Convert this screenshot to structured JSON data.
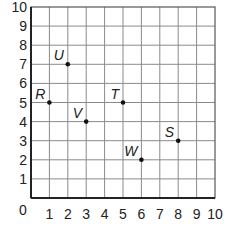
{
  "chart_data": {
    "type": "scatter",
    "title": "",
    "xlabel": "",
    "ylabel": "",
    "xlim": [
      0,
      10
    ],
    "ylim": [
      0,
      10
    ],
    "grid": true,
    "x_ticks": [
      "0",
      "1",
      "2",
      "3",
      "4",
      "5",
      "6",
      "7",
      "8",
      "9",
      "10"
    ],
    "y_ticks": [
      "0",
      "1",
      "2",
      "3",
      "4",
      "5",
      "6",
      "7",
      "8",
      "9",
      "10"
    ],
    "points": [
      {
        "label": "R",
        "x": 1,
        "y": 5
      },
      {
        "label": "U",
        "x": 2,
        "y": 7
      },
      {
        "label": "V",
        "x": 3,
        "y": 4
      },
      {
        "label": "T",
        "x": 5,
        "y": 5
      },
      {
        "label": "W",
        "x": 6,
        "y": 2
      },
      {
        "label": "S",
        "x": 8,
        "y": 3
      }
    ]
  },
  "colors": {
    "grid": "#8a8a8a",
    "axis": "#222222",
    "point": "#111111"
  }
}
